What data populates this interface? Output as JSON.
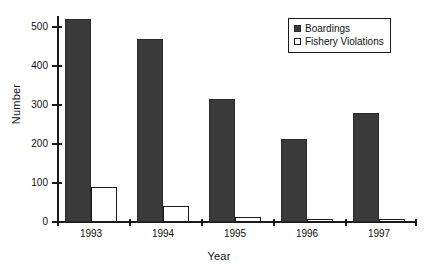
{
  "chart_data": {
    "type": "bar",
    "title": "",
    "xlabel": "Year",
    "ylabel": "Number",
    "categories": [
      "1993",
      "1994",
      "1995",
      "1996",
      "1997"
    ],
    "series": [
      {
        "name": "Boardings",
        "values": [
          520,
          470,
          315,
          212,
          280
        ],
        "color": "#3a3a3a"
      },
      {
        "name": "Fishery Violations",
        "values": [
          90,
          42,
          13,
          6,
          9
        ],
        "color": "#ffffff"
      }
    ],
    "ylim": [
      0,
      520
    ],
    "y_ticks": [
      0,
      100,
      200,
      300,
      400,
      500
    ],
    "y_tick_labels": [
      "0",
      "100",
      "200",
      "300",
      "400",
      "500"
    ],
    "grid": false,
    "legend_position": "top-right"
  },
  "legend": {
    "entries": [
      {
        "label": "Boardings",
        "swatch": "filled-square-icon"
      },
      {
        "label": "Fishery Violations",
        "swatch": "outlined-square-icon"
      }
    ]
  },
  "axes": {
    "y_title": "Number",
    "x_title": "Year"
  }
}
